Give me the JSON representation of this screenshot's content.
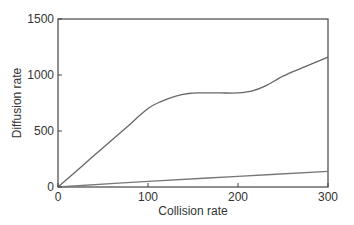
{
  "chart_data": {
    "type": "line",
    "title": "",
    "xlabel": "Collision rate",
    "ylabel": "Diffusion rate",
    "xlim": [
      0,
      300
    ],
    "ylim": [
      0,
      1500
    ],
    "xticks": [
      0,
      100,
      200,
      300
    ],
    "yticks": [
      0,
      500,
      1000,
      1500
    ],
    "xtick_labels": [
      "0",
      "100",
      "200",
      "300"
    ],
    "ytick_labels": [
      "0",
      "500",
      "1000",
      "1500"
    ],
    "grid": false,
    "legend": null,
    "series": [
      {
        "name": "upper curve",
        "color": "#666666",
        "x": [
          0,
          25,
          50,
          75,
          100,
          115,
          130,
          145,
          160,
          180,
          200,
          215,
          230,
          250,
          270,
          300
        ],
        "y": [
          0,
          175,
          350,
          525,
          700,
          765,
          810,
          835,
          840,
          840,
          840,
          855,
          900,
          990,
          1060,
          1160
        ]
      },
      {
        "name": "lower line",
        "color": "#777777",
        "x": [
          0,
          100,
          200,
          300
        ],
        "y": [
          0,
          50,
          95,
          140
        ]
      }
    ]
  },
  "style": {
    "axis_color": "#444444",
    "text_color": "#333333"
  }
}
